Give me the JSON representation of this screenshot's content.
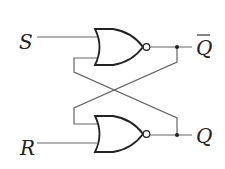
{
  "diagram": {
    "inputs": {
      "s": "S",
      "r": "R"
    },
    "outputs": {
      "q_bar": "Q",
      "q": "Q"
    },
    "colors": {
      "wire": "#555555",
      "gate": "#222222",
      "label": "#222222"
    }
  }
}
